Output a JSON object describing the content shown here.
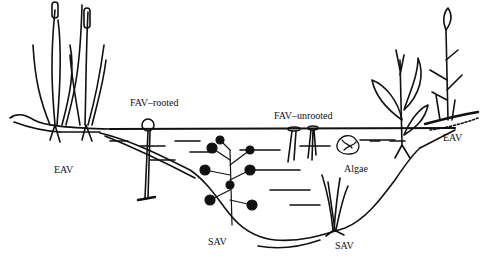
{
  "diagram": {
    "type": "cross-section illustration",
    "style": "black ink line drawing",
    "colors": {
      "ink": "#111111",
      "background": "#ffffff"
    },
    "labels": {
      "eav_left": "EAV",
      "fav_rooted": "FAV–rooted",
      "fav_unrooted": "FAV–unrooted",
      "algae": "Algae",
      "sav_left": "SAV",
      "sav_right": "SAV",
      "eav_right": "EAV"
    }
  }
}
